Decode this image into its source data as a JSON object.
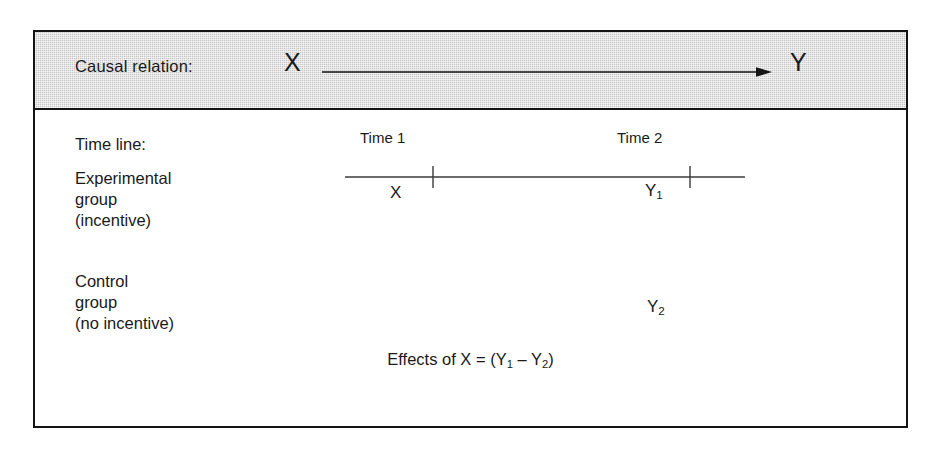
{
  "figure": {
    "header": {
      "row_label": "Causal relation:",
      "cause_symbol": "X",
      "effect_symbol": "Y",
      "arrow": "causal-arrow-right",
      "background_color": "#c9c9c9"
    },
    "timeline": {
      "row_label": "Time line:",
      "ticks": [
        {
          "label": "Time 1"
        },
        {
          "label": "Time 2"
        }
      ]
    },
    "groups": [
      {
        "name": "experimental-group",
        "label_lines": [
          "Experimental",
          "group",
          "(incentive)"
        ],
        "time1_symbol": "X",
        "time2_symbol": "Y",
        "time2_subscript": "1"
      },
      {
        "name": "control-group",
        "label_lines": [
          "Control",
          "group",
          "(no incentive)"
        ],
        "time1_symbol": "",
        "time2_symbol": "Y",
        "time2_subscript": "2"
      }
    ],
    "formula": {
      "prefix": "Effects of X = (Y",
      "sub1": "1",
      "middle": " – Y",
      "sub2": "2",
      "suffix": ")"
    },
    "border_color": "#141414"
  }
}
